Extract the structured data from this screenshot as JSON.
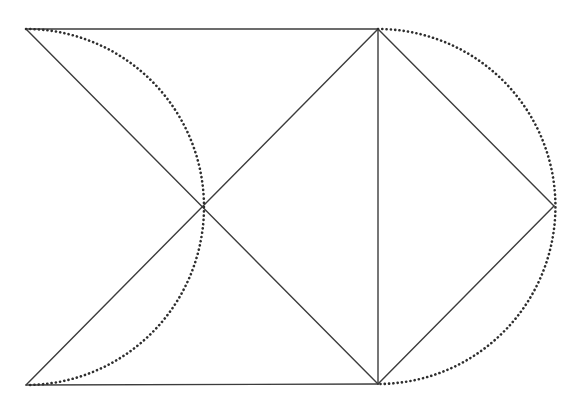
{
  "diagram": {
    "title": "",
    "colors": {
      "background": "#ffffff",
      "line": "#3c3c3c",
      "dots": "#2e2e2e"
    },
    "stroke": {
      "line_width": 1.4,
      "dot_width": 2.6,
      "dot_dash": "0.1 4.2"
    },
    "points": {
      "A_top_left": [
        26,
        29
      ],
      "B_top_right": [
        378,
        29
      ],
      "C_bottom_right": [
        378,
        384
      ],
      "D_bottom_left": [
        26,
        385
      ],
      "O_center": [
        201,
        207
      ],
      "E_right_apex": [
        554,
        206
      ]
    },
    "segments": [
      {
        "id": "top-edge",
        "from": "A_top_left",
        "to": "B_top_right"
      },
      {
        "id": "bottom-edge",
        "from": "D_bottom_left",
        "to": "C_bottom_right"
      },
      {
        "id": "vertical-edge",
        "from": "B_top_right",
        "to": "C_bottom_right"
      },
      {
        "id": "diagonal-A-C",
        "from": "A_top_left",
        "to": "C_bottom_right"
      },
      {
        "id": "diagonal-D-B",
        "from": "D_bottom_left",
        "to": "B_top_right"
      },
      {
        "id": "right-upper-edge",
        "from": "B_top_right",
        "to": "E_right_apex"
      },
      {
        "id": "right-lower-edge",
        "from": "E_right_apex",
        "to": "C_bottom_right"
      }
    ],
    "arcs": [
      {
        "id": "left-dotted-semicircle",
        "center": [
          26,
          207
        ],
        "radius": 177,
        "from": "A_top_left",
        "through": "O_center",
        "to": "D_bottom_left",
        "style": "dotted"
      },
      {
        "id": "right-dotted-semicircle",
        "center": [
          378,
          206.5
        ],
        "radius": 177,
        "from": "B_top_right",
        "through": "E_right_apex",
        "to": "C_bottom_right",
        "style": "dotted"
      }
    ]
  }
}
